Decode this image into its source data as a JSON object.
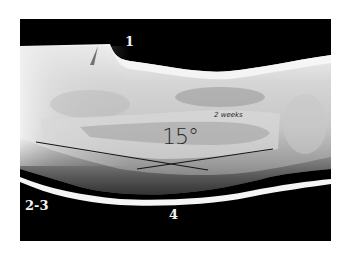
{
  "image": {
    "type": "radiograph",
    "description": "Lateral radiograph of a limb in a cast showing angular deformity"
  },
  "labels": {
    "top": "1",
    "bottom_left": "2-3",
    "bottom": "4"
  },
  "handwritten": {
    "angle": "15°",
    "time": "2 weeks"
  },
  "colors": {
    "background": "#ffffff",
    "film": "#000000",
    "annotation_line": "#1a1a1a",
    "label_text": "#f2f2f2"
  }
}
